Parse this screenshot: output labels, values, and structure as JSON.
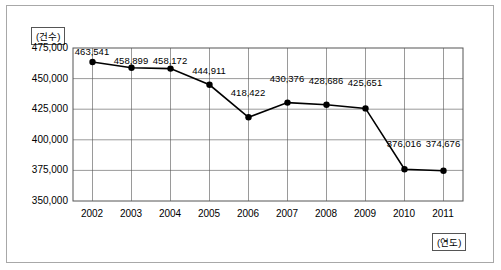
{
  "chart_data": {
    "type": "line",
    "title": "",
    "xlabel": "(연도)",
    "ylabel": "(건수)",
    "categories": [
      "2002",
      "2003",
      "2004",
      "2005",
      "2006",
      "2007",
      "2008",
      "2009",
      "2010",
      "2011"
    ],
    "values": [
      463541,
      458899,
      458172,
      444911,
      418422,
      430376,
      428686,
      425651,
      376016,
      374676
    ],
    "value_labels": [
      "463,541",
      "458,899",
      "458,172",
      "444,911",
      "418,422",
      "430,376",
      "428,686",
      "425,651",
      "376,016",
      "374,676"
    ],
    "ylim": [
      350000,
      475000
    ],
    "yticks": [
      350000,
      375000,
      400000,
      425000,
      450000,
      475000
    ],
    "ytick_labels": [
      "350,000",
      "375,000",
      "400,000",
      "425,000",
      "450,000",
      "475,000"
    ],
    "grid": true,
    "legend": "none",
    "series": [
      {
        "name": "건수",
        "values": [
          463541,
          458899,
          458172,
          444911,
          418422,
          430376,
          428686,
          425651,
          376016,
          374676
        ],
        "color": "#000000",
        "marker": "circle"
      }
    ]
  }
}
